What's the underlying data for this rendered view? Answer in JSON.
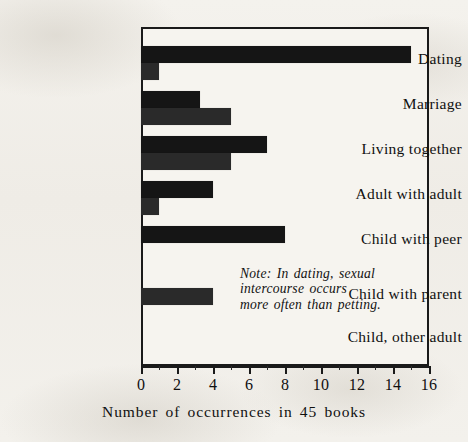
{
  "chart_data": {
    "type": "bar",
    "orientation": "horizontal",
    "title": "",
    "xlabel": "Number of occurrences in 45 books",
    "ylabel": "",
    "xlim": [
      0,
      16
    ],
    "xticks": [
      0,
      2,
      4,
      6,
      8,
      10,
      12,
      14,
      16
    ],
    "xtick_labels": [
      "0",
      "2",
      "4",
      "6",
      "8",
      "10",
      "12",
      "14",
      "16"
    ],
    "minor_tick_step": 1,
    "grid": false,
    "legend": "none",
    "categories": [
      "Dating",
      "Marriage",
      "Living together",
      "Adult with adult",
      "Child with peer",
      "Child with parent",
      "Child, other adult"
    ],
    "series": [
      {
        "name": "sexual intercourse",
        "color": "#151515",
        "values": [
          15,
          3.3,
          7,
          4,
          8,
          0,
          0
        ]
      },
      {
        "name": "petting",
        "color": "#2a2a2a",
        "values": [
          1,
          5,
          5,
          1,
          0,
          4,
          0
        ]
      }
    ],
    "annotations": [
      {
        "name": "note",
        "lines": [
          "Note:  In dating, sexual",
          "intercourse  occurs",
          "more  often  than  petting."
        ]
      }
    ]
  },
  "axis": {
    "x_title": "Number of occurrences in 45 books"
  },
  "note": {
    "line1": "Note:  In dating, sexual",
    "line2": "intercourse  occurs",
    "line3": "more  often  than  petting."
  },
  "colors": {
    "paper": "#f2f0eb",
    "ink": "#151515",
    "bar_primary": "#151515",
    "bar_secondary": "#2a2a2a",
    "frame": "#1a1a1a"
  }
}
